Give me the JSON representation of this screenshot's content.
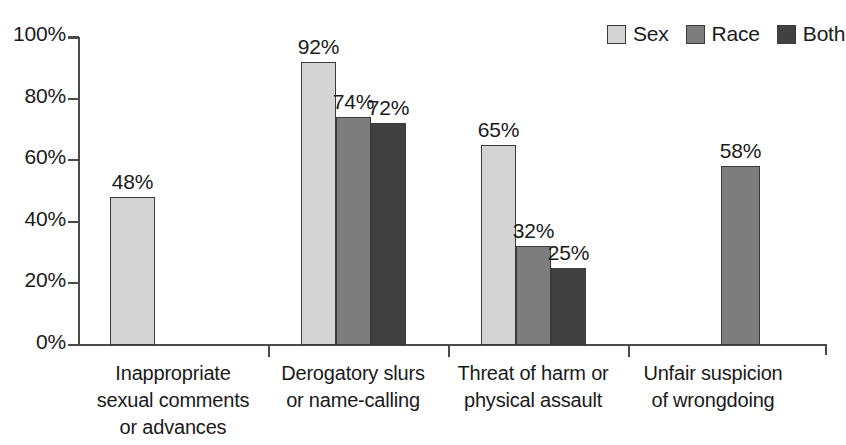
{
  "chart_data": {
    "type": "bar",
    "title": "",
    "subtitle": "",
    "xlabel": "",
    "ylabel": "",
    "ylim": [
      0,
      100
    ],
    "ytick_labels": [
      "0%",
      "20%",
      "40%",
      "60%",
      "80%",
      "100%"
    ],
    "ytick_values": [
      0,
      20,
      40,
      60,
      80,
      100
    ],
    "grid": false,
    "legend_position": "top-right",
    "value_label_suffix": "%",
    "categories": [
      "Inappropriate sexual comments or advances",
      "Derogatory slurs or name-calling",
      "Threat of harm or physical assault",
      "Unfair suspicion of wrongdoing"
    ],
    "category_label_lines": [
      [
        "Inappropriate",
        "sexual comments",
        "or advances"
      ],
      [
        "Derogatory slurs",
        "or name-calling"
      ],
      [
        "Threat of harm or",
        "physical assault"
      ],
      [
        "Unfair suspicion",
        "of wrongdoing"
      ]
    ],
    "series": [
      {
        "name": "Sex",
        "color": "#d4d4d4",
        "values": [
          48,
          92,
          65,
          null
        ]
      },
      {
        "name": "Race",
        "color": "#7d7d7d",
        "values": [
          null,
          74,
          32,
          58
        ]
      },
      {
        "name": "Both",
        "color": "#414141",
        "values": [
          null,
          72,
          25,
          null
        ]
      }
    ],
    "bars": [
      {
        "category": 0,
        "series": "Sex",
        "value": 48,
        "label": "48%"
      },
      {
        "category": 1,
        "series": "Sex",
        "value": 92,
        "label": "92%"
      },
      {
        "category": 1,
        "series": "Race",
        "value": 74,
        "label": "74%"
      },
      {
        "category": 1,
        "series": "Both",
        "value": 72,
        "label": "72%"
      },
      {
        "category": 2,
        "series": "Sex",
        "value": 65,
        "label": "65%"
      },
      {
        "category": 2,
        "series": "Race",
        "value": 32,
        "label": "32%"
      },
      {
        "category": 2,
        "series": "Both",
        "value": 25,
        "label": "25%"
      },
      {
        "category": 3,
        "series": "Race",
        "value": 58,
        "label": "58%"
      }
    ]
  },
  "legend": {
    "items": [
      {
        "label": "Sex",
        "color": "#d4d4d4"
      },
      {
        "label": "Race",
        "color": "#7d7d7d"
      },
      {
        "label": "Both",
        "color": "#414141"
      }
    ]
  },
  "axis": {
    "y_ticks": [
      "0%",
      "20%",
      "40%",
      "60%",
      "80%",
      "100%"
    ]
  },
  "colors": {
    "sex": "#d4d4d4",
    "race": "#7d7d7d",
    "both": "#414141",
    "axis": "#4a4a4a",
    "text": "#1a1a1a",
    "background": "#ffffff"
  }
}
